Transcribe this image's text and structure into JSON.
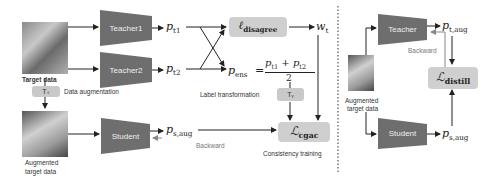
{
  "left_panel": {
    "target_data_label": "Target data",
    "augmented_label_line1": "Augmented",
    "augmented_label_line2": "target data",
    "ts_label": "Tₛ",
    "data_augmentation_label": "Data augmentation",
    "teacher1": "Teacher1",
    "teacher2": "Teacher2",
    "student": "Student",
    "p_t1": "p",
    "p_t1_sub": "t1",
    "p_t2": "p",
    "p_t2_sub": "t2",
    "p_s_aug": "p",
    "p_s_aug_sub": "s,aug",
    "l_disagree": "ℓ",
    "l_disagree_sub": "disagree",
    "w_t": "w",
    "w_t_sub": "t",
    "p_ens": "p",
    "p_ens_sub": "ens",
    "equals": "=",
    "numerator": "p",
    "num_sub1": "t1",
    "num_plus": " + p",
    "num_sub2": "t2",
    "denominator": "2",
    "label_transformation": "Label transformation",
    "ty_label": "Tᵧ",
    "l_cgac": "ℒ",
    "l_cgac_sub": "cgac",
    "backward_label": "Backward",
    "consistency_training": "Consistency training"
  },
  "right_panel": {
    "teacher": "Teacher",
    "student": "Student",
    "p_t_aug": "p",
    "p_t_aug_sub": "t,aug",
    "p_s_aug": "p",
    "p_s_aug_sub": "s,aug",
    "backward_label": "Backward",
    "l_distill": "ℒ",
    "l_distill_sub": "distill",
    "augmented_label_line1": "Augmented",
    "augmented_label_line2": "target data"
  },
  "colors": {
    "network_fill": "#6e6e6e",
    "loss_box_fill": "#cfcfcf",
    "arrow": "#222222",
    "backward_arrow": "#888888",
    "divider": "#555555"
  }
}
